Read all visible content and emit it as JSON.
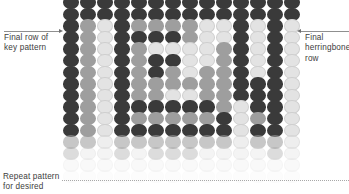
{
  "diagram": {
    "type": "knitting-stitch-chart",
    "grid": {
      "columns": 14,
      "rows": 16,
      "stitch_shape": "oval",
      "col_spacing": 17.0,
      "row_spacing": 11.6,
      "stagger_x": 0,
      "palette": {
        "dark": "#3a3a3a",
        "medium": "#9e9e9e",
        "light": "#e3e3e3",
        "background": "#ffffff"
      },
      "fade": {
        "note": "lower rows fade toward white",
        "first_faded_row": 12,
        "row_opacity": [
          1,
          1,
          1,
          1,
          1,
          1,
          1,
          1,
          1,
          1,
          1,
          1,
          0.58,
          0.36,
          0.2,
          0.08
        ]
      },
      "cells": [
        [
          "dark",
          "dark",
          "dark",
          "dark",
          "dark",
          "dark",
          "dark",
          "dark",
          "dark",
          "dark",
          "dark",
          "dark",
          "dark",
          "dark"
        ],
        [
          "dark",
          "dark",
          "dark",
          "dark",
          "dark",
          "dark",
          "dark",
          "dark",
          "dark",
          "dark",
          "dark",
          "dark",
          "dark",
          "dark"
        ],
        [
          "dark",
          "medium",
          "light",
          "dark",
          "medium",
          "medium",
          "medium",
          "medium",
          "light",
          "light",
          "dark",
          "light",
          "dark",
          "light"
        ],
        [
          "dark",
          "medium",
          "light",
          "dark",
          "dark",
          "dark",
          "dark",
          "medium",
          "light",
          "light",
          "dark",
          "light",
          "dark",
          "light"
        ],
        [
          "dark",
          "medium",
          "light",
          "dark",
          "medium",
          "light",
          "light",
          "light",
          "light",
          "medium",
          "dark",
          "light",
          "dark",
          "light"
        ],
        [
          "dark",
          "medium",
          "light",
          "dark",
          "medium",
          "dark",
          "dark",
          "light",
          "light",
          "medium",
          "dark",
          "light",
          "dark",
          "light"
        ],
        [
          "dark",
          "medium",
          "light",
          "dark",
          "medium",
          "dark",
          "medium",
          "light",
          "medium",
          "medium",
          "dark",
          "light",
          "dark",
          "light"
        ],
        [
          "dark",
          "medium",
          "light",
          "dark",
          "medium",
          "medium",
          "medium",
          "medium",
          "medium",
          "medium",
          "dark",
          "dark",
          "dark",
          "light"
        ],
        [
          "dark",
          "medium",
          "light",
          "dark",
          "medium",
          "medium",
          "light",
          "light",
          "medium",
          "medium",
          "dark",
          "dark",
          "dark",
          "light"
        ],
        [
          "dark",
          "medium",
          "light",
          "dark",
          "dark",
          "dark",
          "dark",
          "dark",
          "dark",
          "medium",
          "light",
          "dark",
          "dark",
          "light"
        ],
        [
          "dark",
          "medium",
          "light",
          "dark",
          "medium",
          "medium",
          "medium",
          "medium",
          "medium",
          "dark",
          "light",
          "medium",
          "dark",
          "light"
        ],
        [
          "dark",
          "medium",
          "light",
          "dark",
          "dark",
          "dark",
          "dark",
          "dark",
          "dark",
          "dark",
          "light",
          "dark",
          "dark",
          "light"
        ],
        [
          "medium",
          "medium",
          "light",
          "medium",
          "medium",
          "medium",
          "medium",
          "medium",
          "medium",
          "medium",
          "light",
          "medium",
          "medium",
          "light"
        ],
        [
          "medium",
          "light",
          "light",
          "medium",
          "light",
          "medium",
          "medium",
          "medium",
          "light",
          "light",
          "light",
          "light",
          "medium",
          "light"
        ],
        [
          "light",
          "light",
          "light",
          "light",
          "light",
          "light",
          "light",
          "light",
          "light",
          "light",
          "light",
          "light",
          "light",
          "light"
        ],
        [
          "light",
          "light",
          "light",
          "light",
          "light",
          "light",
          "light",
          "light",
          "light",
          "light",
          "light",
          "light",
          "light",
          "light"
        ]
      ]
    },
    "annotations": {
      "left": {
        "text": "Final row of\nkey pattern",
        "leader": "horizontal-line-with-arrow-right"
      },
      "right": {
        "text": "Final\nherringbone\nrow",
        "leader": "horizontal-line-with-arrow-left"
      },
      "bottom": {
        "text": "Repeat pattern\nfor desired",
        "leader": "horizontal-dotted-line"
      }
    }
  }
}
